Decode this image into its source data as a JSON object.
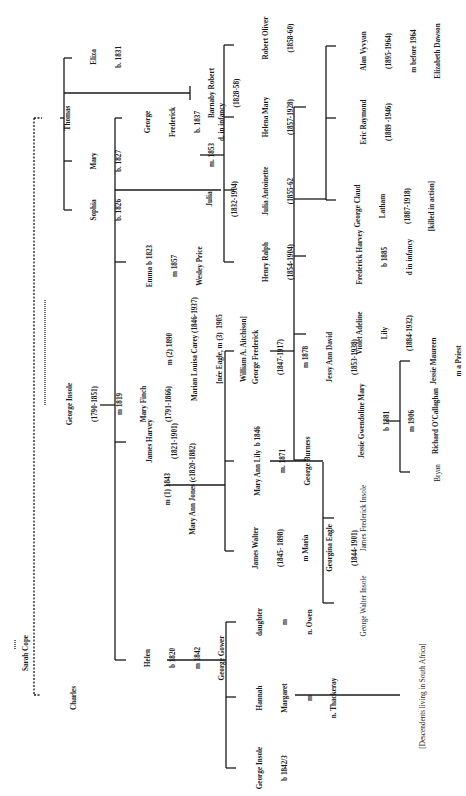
{
  "diagram": {
    "type": "family-tree",
    "orientation": "rotated-90-ccw",
    "line_color": "#1a1a1a",
    "background": "#ffffff",
    "root": {
      "name": "Sarah Cope"
    },
    "people": {
      "sarah": {
        "lines": [
          "Sarah Cope"
        ]
      },
      "thomas": {
        "lines": [
          "Thomas"
        ]
      },
      "george_insole": {
        "lines": [
          "George Insole",
          "(1790-1851)",
          "m 1819",
          "Mary Finch",
          "(1791-1866)"
        ]
      },
      "charles": {
        "lines": [
          "Charles"
        ]
      },
      "eliza": {
        "lines": [
          "Eliza",
          "b. 1831"
        ]
      },
      "mary": {
        "lines": [
          "Mary",
          "b. 1827"
        ]
      },
      "sophia": {
        "lines": [
          "Sophia",
          "b. 1826"
        ]
      },
      "george_frederick_1837": {
        "lines": [
          "George",
          "Frederick",
          "b. 1837",
          "d. in infancy"
        ]
      },
      "barnaby": {
        "lines": [
          "Barnaby Robert",
          "(1828-58)"
        ]
      },
      "julia_marriage": {
        "lines": [
          "m. 1853"
        ]
      },
      "julia": {
        "lines": [
          "Julia",
          "(1832-1904)"
        ]
      },
      "emma": {
        "lines": [
          "Emma b 1823",
          "m 1857",
          "Wesley Price"
        ]
      },
      "james_harvey": {
        "lines": [
          "James Harvey",
          "(1821-1901)"
        ]
      },
      "jh_m2": {
        "lines": [
          "m (2) 1890",
          "Marian Louisa Carey (1846-1937)",
          "[née Eagle, m (3)  1905",
          "William A. Aitchison]"
        ]
      },
      "jh_m1": {
        "lines": [
          "m (1) 1843",
          "Mary Ann Jones (c1820-1882)"
        ]
      },
      "helen": {
        "lines": [
          "Helen",
          "b 1820",
          "m 1842",
          "George Gower"
        ]
      },
      "robert_oliver": {
        "lines": [
          "Robert Oliver",
          "(1858-60)"
        ]
      },
      "helena_mary": {
        "lines": [
          "Helena Mary",
          "(1857-1928)"
        ]
      },
      "julia_antoinette": {
        "lines": [
          "Julia Antoinette",
          "(1855-62"
        ]
      },
      "henry_ralph": {
        "lines": [
          "Henry Ralph",
          "(1854-1904)"
        ]
      },
      "alan_vyvyan": {
        "lines": [
          "Alan Vyvyan",
          "(1895-1964)",
          "m before 1964",
          "Elizabeth Dawson"
        ]
      },
      "eric_raymond": {
        "lines": [
          "Eric Raymond",
          "(1889 -1946)"
        ]
      },
      "george_claud": {
        "lines": [
          "George Claud",
          "Latham",
          "(1887-1918)",
          "[killed in action]"
        ]
      },
      "frederick_harvey": {
        "lines": [
          "Frederick Harvey",
          "b 1885",
          "d in infancy"
        ]
      },
      "violet_adeline": {
        "lines": [
          "Violet Adeline",
          "Lily",
          "(1884-1932)"
        ]
      },
      "george_frederick_1847": {
        "lines": [
          "George Frederick",
          "(1847-1917)",
          "m 1878",
          "Jessy Ann David",
          "(1853-1938)"
        ]
      },
      "mary_ann_lily": {
        "lines": [
          "Mary Ann Lily  b 1846",
          "m. 1871",
          "George Burness"
        ]
      },
      "james_walter": {
        "lines": [
          "James Walter",
          "(1845- 1898)",
          "m Maria",
          "Georgina Eagle",
          "(1844-1901)"
        ]
      },
      "jessie_gwendoline": {
        "lines": [
          "Jessie Gwendoline Mary",
          "b 1881",
          "m 1906",
          "Richard O'Callaghan"
        ]
      },
      "jessie_maureen": {
        "lines": [
          "Jessie Maureen",
          "m a Priest"
        ]
      },
      "bryan": {
        "lines": [
          "Bryan"
        ]
      },
      "james_frederick": {
        "lines": [
          "James Frederick Insole"
        ]
      },
      "george_walter": {
        "lines": [
          "George Walter Insole"
        ]
      },
      "daughter": {
        "lines": [
          "daughter",
          "m",
          "n. Owen"
        ]
      },
      "hannah_margaret": {
        "lines": [
          "Hannah",
          "Margaret",
          "m",
          "n. Thackeray"
        ]
      },
      "george_insole_1842": {
        "lines": [
          "George Insole",
          "b 1842/3"
        ]
      },
      "south_africa": {
        "lines": [
          "[Descendents living in South Africa]"
        ]
      }
    }
  }
}
